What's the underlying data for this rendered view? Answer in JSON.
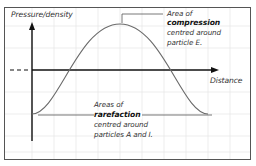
{
  "diagram": {
    "y_axis_label": "Pressure/density",
    "x_axis_label": "Distance",
    "annotations": {
      "compression": {
        "line1": "Area of",
        "line2": "compression",
        "line3": "centred around",
        "line4": "particle E."
      },
      "rarefaction": {
        "line1": "Areas of",
        "line2": "rarefaction",
        "line3": "centred around",
        "line4": "particles A and I."
      }
    },
    "colors": {
      "frame": "#555555",
      "grid": "#e6e6e6",
      "axis": "#111111",
      "curve": "#666666"
    }
  }
}
